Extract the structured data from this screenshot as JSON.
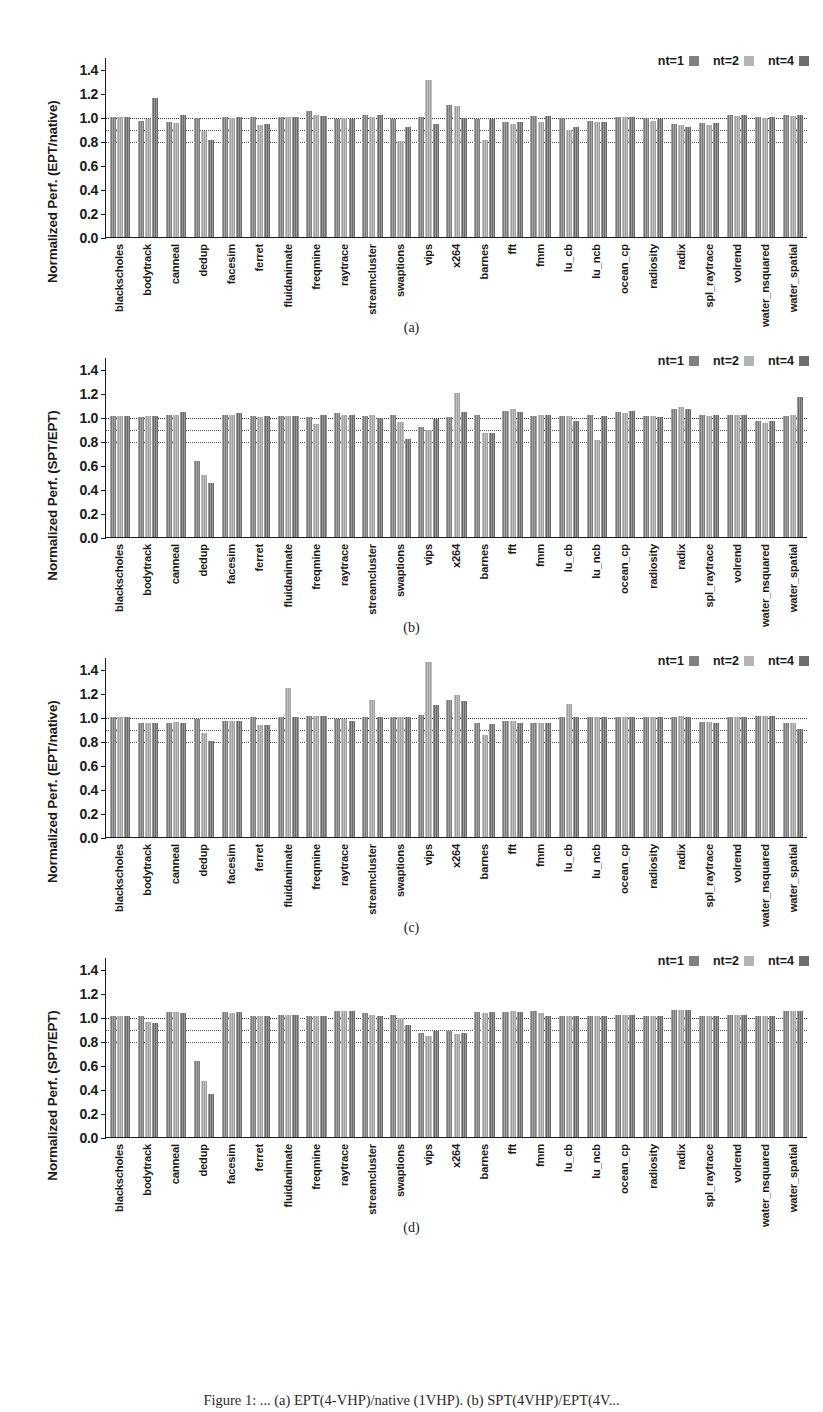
{
  "figure": {
    "caption": "Figure 1: ... (a) EPT(4-VHP)/native (1VHP).  (b)  SPT(4VHP)/EPT(4V...",
    "subcaptions": [
      "(a)",
      "(b)",
      "(c)",
      "(d)"
    ]
  },
  "legend": {
    "entries": [
      {
        "label": "nt=1",
        "color": "#808080"
      },
      {
        "label": "nt=2",
        "color": "#b4b4b4"
      },
      {
        "label": "nt=4",
        "color": "#6e6e6e"
      }
    ]
  },
  "axis": {
    "yticks": [
      "0.0",
      "0.2",
      "0.4",
      "0.6",
      "0.8",
      "1.0",
      "1.2",
      "1.4"
    ],
    "ytick_values": [
      0.0,
      0.2,
      0.4,
      0.6,
      0.8,
      1.0,
      1.2,
      1.4
    ],
    "gridlines": [
      0.8,
      0.9,
      1.0
    ],
    "categories": [
      "blackscholes",
      "bodytrack",
      "canneal",
      "dedup",
      "facesim",
      "ferret",
      "fluidanimate",
      "freqmine",
      "raytrace",
      "streamcluster",
      "swaptions",
      "vips",
      "x264",
      "barnes",
      "fft",
      "fmm",
      "lu_cb",
      "lu_ncb",
      "ocean_cp",
      "radiosity",
      "radix",
      "spl_raytrace",
      "volrend",
      "water_nsquared",
      "water_spatial"
    ]
  },
  "chart_data": [
    {
      "type": "bar",
      "panel": "a",
      "title": "",
      "xlabel": "",
      "ylabel": "Normalized Perf. (EPT/native)",
      "ylim": [
        0.0,
        1.5
      ],
      "grid": true,
      "gridlines": [
        0.8,
        0.9,
        1.0
      ],
      "legend_position": "top-right",
      "categories": [
        "blackscholes",
        "bodytrack",
        "canneal",
        "dedup",
        "facesim",
        "ferret",
        "fluidanimate",
        "freqmine",
        "raytrace",
        "streamcluster",
        "swaptions",
        "vips",
        "x264",
        "barnes",
        "fft",
        "fmm",
        "lu_cb",
        "lu_ncb",
        "ocean_cp",
        "radiosity",
        "radix",
        "spl_raytrace",
        "volrend",
        "water_nsquared",
        "water_spatial"
      ],
      "series": [
        {
          "name": "nt=1",
          "values": [
            1.0,
            0.97,
            0.96,
            0.99,
            1.0,
            1.0,
            1.0,
            1.05,
            0.98,
            1.02,
            0.98,
            1.0,
            1.1,
            0.98,
            0.96,
            1.01,
            0.99,
            0.97,
            1.0,
            0.99,
            0.94,
            0.95,
            1.02,
            1.0,
            1.02
          ]
        },
        {
          "name": "nt=2",
          "values": [
            1.0,
            0.98,
            0.95,
            0.88,
            0.99,
            0.93,
            1.0,
            1.02,
            0.99,
            1.0,
            0.8,
            1.31,
            1.09,
            0.81,
            0.94,
            0.96,
            0.89,
            0.96,
            1.0,
            0.97,
            0.93,
            0.93,
            1.01,
            0.99,
            1.01
          ]
        },
        {
          "name": "nt=4",
          "values": [
            1.0,
            1.16,
            1.02,
            0.81,
            1.0,
            0.94,
            1.0,
            1.01,
            0.98,
            1.02,
            0.92,
            0.94,
            0.99,
            0.98,
            0.96,
            1.01,
            0.92,
            0.96,
            1.0,
            0.98,
            0.92,
            0.95,
            1.02,
            1.0,
            1.02
          ]
        }
      ]
    },
    {
      "type": "bar",
      "panel": "b",
      "title": "",
      "xlabel": "",
      "ylabel": "Normalized Perf. (SPT/EPT)",
      "ylim": [
        0.0,
        1.5
      ],
      "grid": true,
      "gridlines": [
        0.8,
        0.9,
        1.0
      ],
      "legend_position": "top-right",
      "categories": [
        "blackscholes",
        "bodytrack",
        "canneal",
        "dedup",
        "facesim",
        "ferret",
        "fluidanimate",
        "freqmine",
        "raytrace",
        "streamcluster",
        "swaptions",
        "vips",
        "x264",
        "barnes",
        "fft",
        "fmm",
        "lu_cb",
        "lu_ncb",
        "ocean_cp",
        "radiosity",
        "radix",
        "spl_raytrace",
        "volrend",
        "water_nsquared",
        "water_spatial"
      ],
      "series": [
        {
          "name": "nt=1",
          "values": [
            1.01,
            1.0,
            1.02,
            0.63,
            1.02,
            1.01,
            1.01,
            1.0,
            1.03,
            1.01,
            1.02,
            0.92,
            1.0,
            1.02,
            1.05,
            1.01,
            1.01,
            1.02,
            1.04,
            1.01,
            1.07,
            1.02,
            1.02,
            0.97,
            1.01
          ]
        },
        {
          "name": "nt=2",
          "values": [
            1.01,
            1.01,
            1.02,
            0.52,
            1.02,
            1.0,
            1.01,
            0.94,
            1.02,
            1.02,
            0.96,
            0.89,
            1.2,
            0.87,
            1.07,
            1.02,
            1.01,
            0.81,
            1.03,
            1.01,
            1.08,
            1.01,
            1.02,
            0.95,
            1.02
          ]
        },
        {
          "name": "nt=4",
          "values": [
            1.01,
            1.01,
            1.04,
            0.45,
            1.03,
            1.01,
            1.01,
            1.02,
            1.02,
            0.99,
            0.82,
            0.98,
            1.04,
            0.87,
            1.04,
            1.02,
            0.97,
            1.01,
            1.05,
            1.0,
            1.07,
            1.02,
            1.02,
            0.97,
            1.17
          ]
        }
      ]
    },
    {
      "type": "bar",
      "panel": "c",
      "title": "",
      "xlabel": "",
      "ylabel": "Normalized Perf. (EPT/native)",
      "ylim": [
        0.0,
        1.5
      ],
      "grid": true,
      "gridlines": [
        0.8,
        0.9,
        1.0
      ],
      "legend_position": "top-right",
      "categories": [
        "blackscholes",
        "bodytrack",
        "canneal",
        "dedup",
        "facesim",
        "ferret",
        "fluidanimate",
        "freqmine",
        "raytrace",
        "streamcluster",
        "swaptions",
        "vips",
        "x264",
        "barnes",
        "fft",
        "fmm",
        "lu_cb",
        "lu_ncb",
        "ocean_cp",
        "radiosity",
        "radix",
        "spl_raytrace",
        "volrend",
        "water_nsquared",
        "water_spatial"
      ],
      "series": [
        {
          "name": "nt=1",
          "values": [
            1.0,
            0.95,
            0.95,
            0.98,
            0.97,
            1.0,
            1.0,
            1.01,
            0.98,
            1.0,
            1.0,
            1.02,
            1.14,
            0.95,
            0.97,
            0.95,
            1.0,
            1.0,
            1.0,
            1.0,
            1.0,
            0.96,
            1.0,
            1.01,
            0.95
          ]
        },
        {
          "name": "nt=2",
          "values": [
            1.0,
            0.95,
            0.96,
            0.87,
            0.97,
            0.93,
            1.24,
            1.01,
            0.98,
            1.14,
            1.0,
            1.46,
            1.18,
            0.85,
            0.97,
            0.95,
            1.11,
            1.0,
            1.0,
            1.0,
            1.01,
            0.96,
            1.0,
            1.01,
            0.95
          ]
        },
        {
          "name": "nt=4",
          "values": [
            1.0,
            0.95,
            0.95,
            0.8,
            0.97,
            0.93,
            1.0,
            1.01,
            0.97,
            1.0,
            1.0,
            1.1,
            1.13,
            0.94,
            0.95,
            0.95,
            1.0,
            1.0,
            1.0,
            1.0,
            1.0,
            0.95,
            1.0,
            1.01,
            0.9
          ]
        }
      ]
    },
    {
      "type": "bar",
      "panel": "d",
      "title": "",
      "xlabel": "",
      "ylabel": "Normalized Perf. (SPT/EPT)",
      "ylim": [
        0.0,
        1.5
      ],
      "grid": true,
      "gridlines": [
        0.8,
        0.9,
        1.0
      ],
      "legend_position": "top-right",
      "categories": [
        "blackscholes",
        "bodytrack",
        "canneal",
        "dedup",
        "facesim",
        "ferret",
        "fluidanimate",
        "freqmine",
        "raytrace",
        "streamcluster",
        "swaptions",
        "vips",
        "x264",
        "barnes",
        "fft",
        "fmm",
        "lu_cb",
        "lu_ncb",
        "ocean_cp",
        "radiosity",
        "radix",
        "spl_raytrace",
        "volrend",
        "water_nsquared",
        "water_spatial"
      ],
      "series": [
        {
          "name": "nt=1",
          "values": [
            1.01,
            1.01,
            1.04,
            0.63,
            1.04,
            1.01,
            1.02,
            1.01,
            1.05,
            1.03,
            1.02,
            0.87,
            0.88,
            1.04,
            1.04,
            1.05,
            1.01,
            1.01,
            1.02,
            1.01,
            1.06,
            1.01,
            1.02,
            1.01,
            1.05
          ]
        },
        {
          "name": "nt=2",
          "values": [
            1.01,
            0.96,
            1.04,
            0.47,
            1.03,
            1.01,
            1.02,
            1.01,
            1.05,
            1.02,
            0.99,
            0.84,
            0.86,
            1.03,
            1.05,
            1.03,
            1.01,
            1.01,
            1.02,
            1.01,
            1.06,
            1.01,
            1.02,
            1.01,
            1.05
          ]
        },
        {
          "name": "nt=4",
          "values": [
            1.01,
            0.95,
            1.03,
            0.36,
            1.04,
            1.01,
            1.02,
            1.01,
            1.05,
            1.01,
            0.93,
            0.88,
            0.87,
            1.04,
            1.04,
            1.01,
            1.01,
            1.01,
            1.02,
            1.01,
            1.06,
            1.01,
            1.02,
            1.01,
            1.05
          ]
        }
      ]
    }
  ]
}
